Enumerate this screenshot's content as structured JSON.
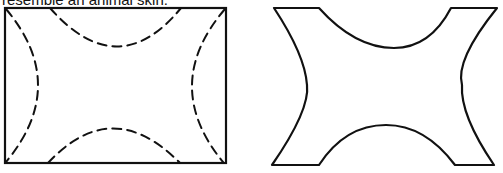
{
  "caption": "resemble an animal skin.",
  "figures": [
    {
      "name": "rectangle-with-dashed-cut-lines",
      "description": "Rectangle with four dashed concave arcs marking cut lines"
    },
    {
      "name": "animal-skin-shape",
      "description": "Resulting shape after cutting along dashed arcs"
    }
  ],
  "colors": {
    "stroke": "#111111",
    "background": "#ffffff"
  }
}
